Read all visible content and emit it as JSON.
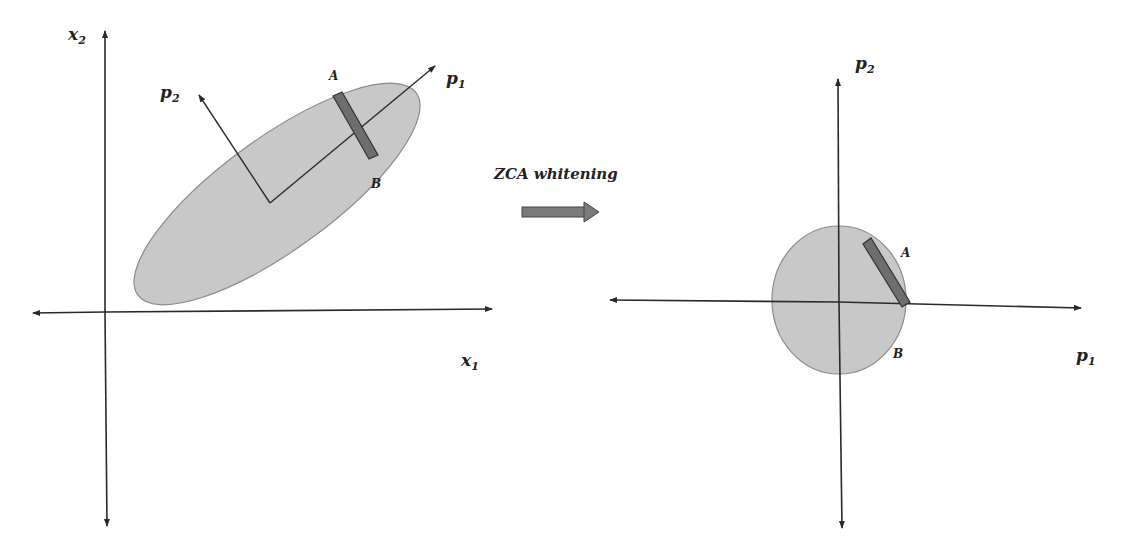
{
  "title": "ZCA whitening",
  "colors": {
    "background": "#ffffff",
    "axis": "#2a2a2a",
    "blob_fill": "#c8c8c8",
    "blob_stroke": "#8a8a8a",
    "bar_fill": "#6e6e6e",
    "bar_stroke": "#333333",
    "arrow_fill": "#7a7a7a"
  },
  "left_panel": {
    "x_axis_label": "x",
    "x_axis_sub": "1",
    "y_axis_label": "x",
    "y_axis_sub": "2",
    "pc1_label": "p",
    "pc1_sub": "1",
    "pc2_label": "p",
    "pc2_sub": "2",
    "point_a": "A",
    "point_b": "B",
    "shape": "ellipse"
  },
  "transform": {
    "label": "ZCA whitening",
    "icon": "right-arrow-icon"
  },
  "right_panel": {
    "x_axis_label": "p",
    "x_axis_sub": "1",
    "y_axis_label": "p",
    "y_axis_sub": "2",
    "point_a": "A",
    "point_b": "B",
    "shape": "circle"
  }
}
